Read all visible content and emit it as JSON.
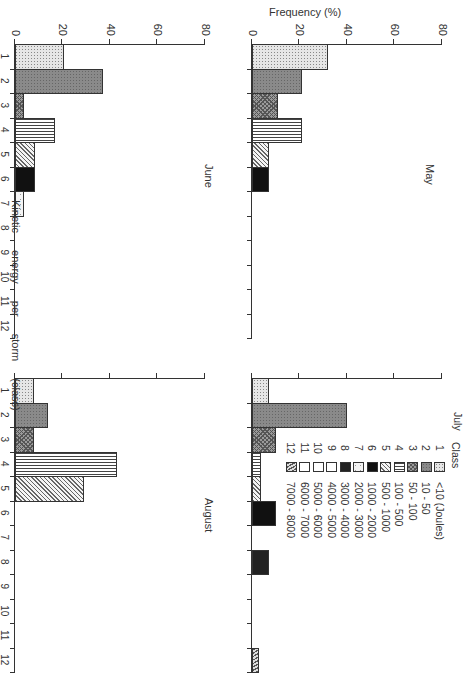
{
  "figure": {
    "ylabel": "Frequency (%)",
    "xlabel": "Kinetic energy per storm (class)",
    "orientation": "rotated 90 degrees clockwise"
  },
  "legend": {
    "title": "Class",
    "items": [
      {
        "class": "1",
        "range": "<10 (Joules)",
        "pattern": "light stipple"
      },
      {
        "class": "2",
        "range": "10 - 50",
        "pattern": "dark grey stipple"
      },
      {
        "class": "3",
        "range": "50 - 100",
        "pattern": "cross-hatch"
      },
      {
        "class": "4",
        "range": "100 - 500",
        "pattern": "vertical lines"
      },
      {
        "class": "5",
        "range": "500 - 1000",
        "pattern": "diagonal lines"
      },
      {
        "class": "6",
        "range": "1000 - 2000",
        "pattern": "solid black"
      },
      {
        "class": "7",
        "range": "2000 - 3000",
        "pattern": "light sparse dots"
      },
      {
        "class": "8",
        "range": "3000 - 4000",
        "pattern": "solid dark"
      },
      {
        "class": "9",
        "range": "4000 - 5000",
        "pattern": "white"
      },
      {
        "class": "10",
        "range": "5000 - 6000",
        "pattern": "white"
      },
      {
        "class": "11",
        "range": "6000 - 7000",
        "pattern": "white"
      },
      {
        "class": "12",
        "range": "7000 - 8000",
        "pattern": "hatched"
      }
    ]
  },
  "axis": {
    "y_ticks": [
      "0",
      "20",
      "40",
      "60",
      "80"
    ],
    "x_ticks": [
      "1",
      "2",
      "3",
      "4",
      "5",
      "6",
      "7",
      "8",
      "9",
      "10",
      "11",
      "12"
    ]
  },
  "panels": {
    "may": {
      "title": "May"
    },
    "july": {
      "title": "July"
    },
    "june": {
      "title": "June"
    },
    "august": {
      "title": "August"
    }
  },
  "chart_data": {
    "type": "bar",
    "title": "",
    "xlabel": "Kinetic energy per storm (class)",
    "ylabel": "Frequency (%)",
    "ylim": [
      0,
      80
    ],
    "grid": false,
    "legend_position": "upper right (July panel)",
    "categories": [
      "1",
      "2",
      "3",
      "4",
      "5",
      "6",
      "7",
      "8",
      "9",
      "10",
      "11",
      "12"
    ],
    "category_ranges_joules": [
      "<10",
      "10-50",
      "50-100",
      "100-500",
      "500-1000",
      "1000-2000",
      "2000-3000",
      "3000-4000",
      "4000-5000",
      "5000-6000",
      "6000-7000",
      "7000-8000"
    ],
    "series": [
      {
        "name": "May",
        "values": [
          32,
          21,
          11,
          21,
          7,
          7,
          0,
          0,
          0,
          0,
          0,
          0
        ]
      },
      {
        "name": "July",
        "values": [
          7,
          40,
          10,
          4,
          4,
          10,
          0,
          7,
          0,
          0,
          0,
          3
        ]
      },
      {
        "name": "June",
        "values": [
          20.5,
          37,
          4,
          17,
          8.5,
          8.5,
          4,
          0,
          0,
          0,
          0,
          0
        ]
      },
      {
        "name": "August",
        "values": [
          8,
          14,
          8,
          43,
          29,
          0,
          0,
          0,
          0,
          0,
          0,
          0
        ]
      }
    ]
  }
}
